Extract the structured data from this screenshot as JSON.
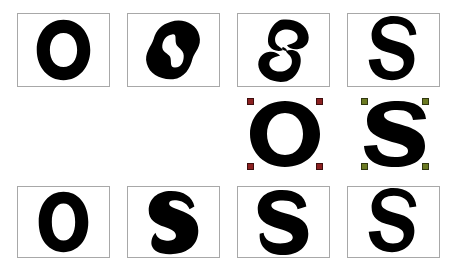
{
  "figure": {
    "background_color": "#ffffff",
    "glyph_color": "#000000",
    "panel_border_color": "#a8a8a8",
    "width": 458,
    "height": 272
  },
  "markers": {
    "source_o_color": "#8B2020",
    "source_s_color": "#6B7A22",
    "count_per_letter": 4,
    "positions": [
      "top-left",
      "top-right",
      "bottom-left",
      "bottom-right"
    ],
    "shape": "square"
  },
  "rows": [
    {
      "id": "top-row",
      "name": "morph-sequence-upper",
      "framed": true,
      "cells": [
        {
          "name": "cell-top-1",
          "letter": "O",
          "state": "source",
          "shape": "o-round",
          "framed": true
        },
        {
          "name": "cell-top-2",
          "letter": "O",
          "state": "morph",
          "shape": "o-blob",
          "framed": true
        },
        {
          "name": "cell-top-3",
          "letter": "O",
          "state": "morph",
          "shape": "os-broken",
          "framed": true
        },
        {
          "name": "cell-top-4",
          "letter": "S",
          "state": "target",
          "shape": "s-plain",
          "framed": true
        }
      ]
    },
    {
      "id": "middle-row",
      "name": "source-letters-with-control-points",
      "framed": false,
      "cells": [
        {
          "name": "cell-mid-1",
          "letter": "",
          "state": "empty",
          "shape": "none",
          "framed": false
        },
        {
          "name": "cell-mid-2",
          "letter": "",
          "state": "empty",
          "shape": "none",
          "framed": false
        },
        {
          "name": "cell-mid-3",
          "letter": "O",
          "state": "source-marked",
          "shape": "o-bold",
          "framed": false,
          "marker_color": "#8B2020"
        },
        {
          "name": "cell-mid-4",
          "letter": "S",
          "state": "source-marked",
          "shape": "s-bold",
          "framed": false,
          "marker_color": "#6B7A22"
        }
      ]
    },
    {
      "id": "bottom-row",
      "name": "morph-sequence-lower",
      "framed": true,
      "cells": [
        {
          "name": "cell-bot-1",
          "letter": "O",
          "state": "source",
          "shape": "o-narrow",
          "framed": true
        },
        {
          "name": "cell-bot-2",
          "letter": "S",
          "state": "morph",
          "shape": "s-fat",
          "framed": true
        },
        {
          "name": "cell-bot-3",
          "letter": "S",
          "state": "morph",
          "shape": "s-heavy",
          "framed": true
        },
        {
          "name": "cell-bot-4",
          "letter": "S",
          "state": "target",
          "shape": "s-plain",
          "framed": true
        }
      ]
    }
  ]
}
